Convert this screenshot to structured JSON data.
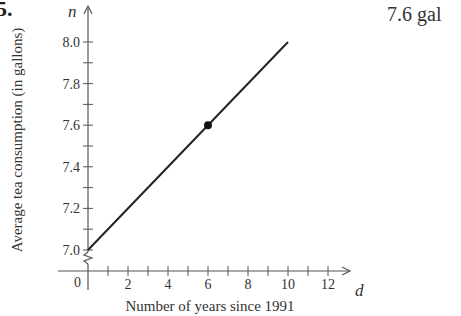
{
  "problem_number": "5.",
  "answer": "7.6 gal",
  "chart_data": {
    "type": "line",
    "title": "",
    "xlabel": "Number of years since 1991",
    "ylabel": "Average tea consumption (in gallons)",
    "x_axis_var": "d",
    "y_axis_var": "n",
    "origin_label": "0",
    "x_ticks": [
      2,
      4,
      6,
      8,
      10,
      12
    ],
    "x_tick_labels": [
      "2",
      "4",
      "6",
      "8",
      "10",
      "12"
    ],
    "y_ticks": [
      7.0,
      7.2,
      7.4,
      7.6,
      7.8,
      8.0
    ],
    "y_tick_labels": [
      "7.0",
      "7.2",
      "7.4",
      "7.6",
      "7.8",
      "8.0"
    ],
    "xlim": [
      0,
      13
    ],
    "ylim": [
      7.0,
      8.0
    ],
    "y_axis_break": true,
    "grid": false,
    "series": [
      {
        "name": "tea consumption",
        "x": [
          0,
          10
        ],
        "y": [
          7.0,
          8.0
        ]
      }
    ],
    "highlighted_points": [
      {
        "x": 6,
        "y": 7.6
      }
    ]
  }
}
